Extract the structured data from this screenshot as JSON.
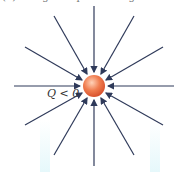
{
  "caption": "(b) A negative point charge",
  "charge_label": "Q < 0",
  "colors": {
    "field_line": "#2f3a5a",
    "charge": "#e8744a",
    "background": "#ffffff"
  },
  "diagram": {
    "type": "electric field lines",
    "charge_sign": "negative",
    "line_count": 12,
    "arrow_direction": "inward toward charge"
  }
}
